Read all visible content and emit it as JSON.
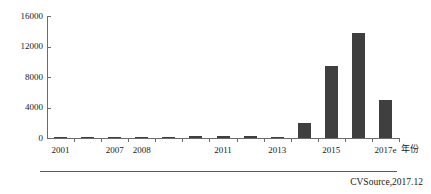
{
  "chart_data": {
    "type": "bar",
    "title": "",
    "subtitle": "",
    "xlabel": "年份",
    "ylabel": "",
    "ylim": [
      0,
      16000
    ],
    "yticks": [
      0,
      4000,
      8000,
      12000,
      16000
    ],
    "ytick_labels": [
      "0",
      "4000",
      "8000",
      "12000",
      "16000"
    ],
    "grid": false,
    "legend": null,
    "categories": [
      "2001",
      "2006",
      "2007",
      "2008",
      "2009",
      "2010",
      "2011",
      "2012",
      "2013",
      "2014",
      "2015",
      "2016",
      "2017e"
    ],
    "xtick_labels": [
      "2001",
      "2007",
      "2008",
      "2011",
      "2013",
      "2015",
      "2017e"
    ],
    "values": [
      60,
      70,
      80,
      90,
      150,
      260,
      300,
      280,
      90,
      1970,
      9400,
      13800,
      4980
    ],
    "source": "CVSource,2017.12",
    "bar_color": "#3f3f3f",
    "axis_color": "#6b6b6b"
  }
}
